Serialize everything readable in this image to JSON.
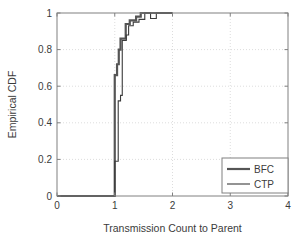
{
  "chart_data": {
    "type": "line",
    "title": "",
    "xlabel": "Transmission Count to Parent",
    "ylabel": "Empirical CDF",
    "xlim": [
      0,
      4
    ],
    "ylim": [
      0,
      1
    ],
    "xticks": [
      "0",
      "1",
      "2",
      "3",
      "4"
    ],
    "xtick_values": [
      0,
      1,
      2,
      3,
      4
    ],
    "yticks": [
      "0",
      "0.2",
      "0.4",
      "0.6",
      "0.8",
      "1"
    ],
    "ytick_values": [
      0,
      0.2,
      0.4,
      0.6,
      0.8,
      1
    ],
    "grid": true,
    "grid_style": "dotted",
    "legend_position": "lower right",
    "step_style": "post",
    "series": [
      {
        "name": "BFC",
        "color": "#555555",
        "line_width": 2.2,
        "points": [
          [
            0.0,
            0.0
          ],
          [
            1.0,
            0.0
          ],
          [
            1.0,
            0.66
          ],
          [
            1.04,
            0.66
          ],
          [
            1.04,
            0.72
          ],
          [
            1.07,
            0.72
          ],
          [
            1.07,
            0.8
          ],
          [
            1.1,
            0.8
          ],
          [
            1.1,
            0.86
          ],
          [
            1.19,
            0.86
          ],
          [
            1.19,
            0.94
          ],
          [
            1.26,
            0.94
          ],
          [
            1.26,
            0.96
          ],
          [
            1.37,
            0.96
          ],
          [
            1.37,
            0.98
          ],
          [
            1.45,
            0.98
          ],
          [
            1.45,
            1.0
          ],
          [
            2.0,
            1.0
          ]
        ]
      },
      {
        "name": "CTP",
        "color": "#3b3b3b",
        "line_width": 1.1,
        "points": [
          [
            0.0,
            0.0
          ],
          [
            1.0,
            0.0
          ],
          [
            1.0,
            0.19
          ],
          [
            1.06,
            0.19
          ],
          [
            1.06,
            0.52
          ],
          [
            1.1,
            0.52
          ],
          [
            1.1,
            0.55
          ],
          [
            1.13,
            0.55
          ],
          [
            1.13,
            0.85
          ],
          [
            1.2,
            0.85
          ],
          [
            1.2,
            0.88
          ],
          [
            1.24,
            0.88
          ],
          [
            1.24,
            0.93
          ],
          [
            1.32,
            0.93
          ],
          [
            1.32,
            0.95
          ],
          [
            1.42,
            0.95
          ],
          [
            1.42,
            0.965
          ],
          [
            1.52,
            0.965
          ],
          [
            1.52,
            1.0
          ],
          [
            1.62,
            1.0
          ],
          [
            1.62,
            0.97
          ],
          [
            1.72,
            0.97
          ],
          [
            1.72,
            1.0
          ],
          [
            2.0,
            1.0
          ]
        ]
      }
    ],
    "legend_entries": [
      {
        "label": "BFC",
        "color": "#555555",
        "line_width": 2.2
      },
      {
        "label": "CTP",
        "color": "#3b3b3b",
        "line_width": 1.1
      }
    ]
  },
  "axes": {
    "frame_color": "#808080",
    "background": "#ffffff",
    "grid_color": "#cfcfcf"
  }
}
